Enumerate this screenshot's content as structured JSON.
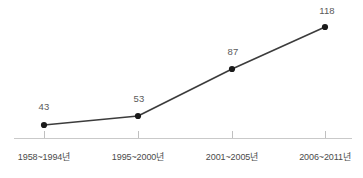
{
  "chart_data": {
    "type": "line",
    "title": "",
    "subtitle": "",
    "xlabel": "",
    "ylabel": "",
    "grid": false,
    "legend": "none",
    "categories": [
      "1958~1994년",
      "1995~2000년",
      "2001~2005년",
      "2006~2011년"
    ],
    "values": [
      43,
      53,
      87,
      118
    ],
    "data_labels": [
      "43",
      "53",
      "87",
      "118"
    ],
    "series": [
      {
        "name": "",
        "values": [
          43,
          53,
          87,
          118
        ]
      }
    ],
    "ylim": [
      0,
      130
    ],
    "xlim": [
      0,
      3
    ],
    "axis_ticks_visible": true,
    "yaxis_visible": false,
    "marker": "filled-circle"
  },
  "style": {
    "background": "#ffffff",
    "line_color": "#3c3c3c",
    "marker_color": "#1a1a1a",
    "axis_color": "#c9c9c9",
    "tick_color": "#c0c0c0",
    "value_label_color": "#5a5a5a",
    "category_label_color": "#4a4a4a"
  },
  "geometry": {
    "points": [
      {
        "x": 44,
        "y": 125,
        "label_x": 44,
        "label_y": 102
      },
      {
        "x": 138,
        "y": 116,
        "label_x": 139,
        "label_y": 94
      },
      {
        "x": 232,
        "y": 69,
        "label_x": 233,
        "label_y": 47
      },
      {
        "x": 325,
        "y": 27,
        "label_x": 327,
        "label_y": 6
      }
    ],
    "axis_y": 138,
    "axis_x_start": 14,
    "axis_x_end": 352,
    "tick_top": 131,
    "category_label_y": 153
  }
}
